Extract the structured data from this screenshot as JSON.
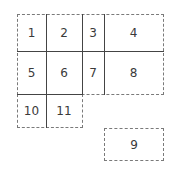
{
  "diagram": {
    "type": "grid-layout",
    "cells": [
      {
        "label": "1",
        "x": 17,
        "y": 14,
        "w": 29,
        "h": 37
      },
      {
        "label": "2",
        "x": 46,
        "y": 14,
        "w": 36,
        "h": 37
      },
      {
        "label": "3",
        "x": 82,
        "y": 14,
        "w": 22,
        "h": 37
      },
      {
        "label": "4",
        "x": 104,
        "y": 14,
        "w": 59,
        "h": 37
      },
      {
        "label": "5",
        "x": 17,
        "y": 51,
        "w": 29,
        "h": 43
      },
      {
        "label": "6",
        "x": 46,
        "y": 51,
        "w": 36,
        "h": 43
      },
      {
        "label": "7",
        "x": 82,
        "y": 51,
        "w": 22,
        "h": 43
      },
      {
        "label": "8",
        "x": 104,
        "y": 51,
        "w": 59,
        "h": 43
      },
      {
        "label": "10",
        "x": 17,
        "y": 94,
        "w": 29,
        "h": 33
      },
      {
        "label": "11",
        "x": 46,
        "y": 94,
        "w": 36,
        "h": 33
      },
      {
        "label": "9",
        "x": 104,
        "y": 128,
        "w": 59,
        "h": 32
      }
    ],
    "colors": {
      "solid_line": "#444444",
      "dashed_line": "#7a7a7a",
      "text": "#3a3a3a"
    }
  }
}
